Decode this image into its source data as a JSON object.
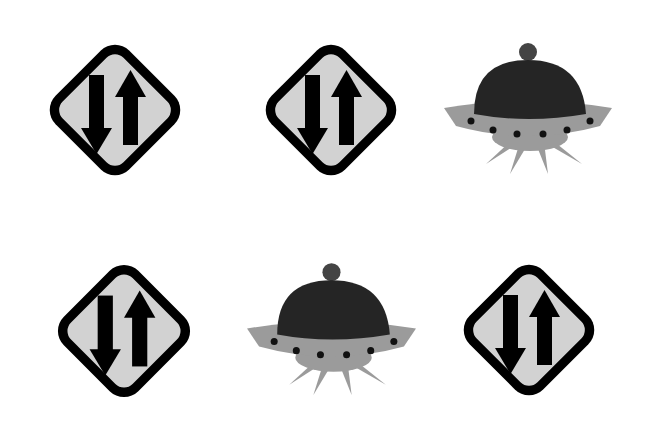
{
  "scene": {
    "background": "#ffffff",
    "description": "Grid of six icons: two-way traffic signs and flying saucers",
    "items": [
      {
        "type": "two-way-traffic-sign",
        "x": 35,
        "y": 30,
        "size": 160
      },
      {
        "type": "two-way-traffic-sign",
        "x": 251,
        "y": 30,
        "size": 160
      },
      {
        "type": "ufo",
        "x": 440,
        "y": 42,
        "w": 176,
        "h": 132
      },
      {
        "type": "two-way-traffic-sign",
        "x": 43,
        "y": 250,
        "size": 162
      },
      {
        "type": "ufo",
        "x": 243,
        "y": 262,
        "w": 177,
        "h": 133
      },
      {
        "type": "two-way-traffic-sign",
        "x": 449,
        "y": 250,
        "size": 160
      }
    ]
  },
  "colors": {
    "sign_border": "#000000",
    "sign_face": "#d2d2d2",
    "arrow": "#000000",
    "ufo_dome": "#252525",
    "ufo_body": "#9b9b9b",
    "ufo_lights": "#111111"
  }
}
